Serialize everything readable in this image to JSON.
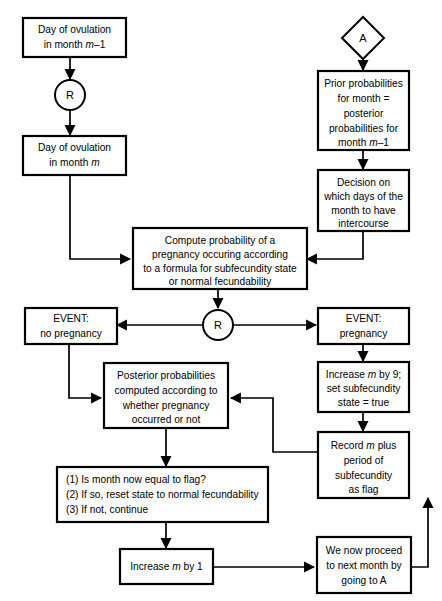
{
  "diagram": {
    "colors": {
      "background": "#ffffff",
      "stroke": "#000000",
      "fill": "#ffffff"
    },
    "nodes": {
      "day_ovulation_prev": {
        "line1": "Day of ovulation",
        "line2a": "in month ",
        "line2b": "m",
        "line2c": "–1"
      },
      "connector_r_top": {
        "label": "R"
      },
      "day_ovulation_cur": {
        "line1": "Day of ovulation",
        "line2a": "in month ",
        "line2b": "m"
      },
      "connector_a": {
        "label": "A"
      },
      "prior_probabilities": {
        "line1": "Prior probabilities",
        "line2": "for month =",
        "line3": "posterior",
        "line4": "probabilities for",
        "line5a": "month ",
        "line5b": "m",
        "line5c": "–1"
      },
      "decision_days": {
        "line1": "Decision on",
        "line2": "which days of the",
        "line3": "month to have",
        "line4": "intercourse"
      },
      "compute_probability": {
        "line1": "Compute probability of a",
        "line2": "pregnancy occuring according",
        "line3": "to a formula for subfecundity state",
        "line4": "or normal fecundability"
      },
      "connector_r_mid": {
        "label": "R"
      },
      "event_no_pregnancy": {
        "line1": "EVENT:",
        "line2": "no pregnancy"
      },
      "event_pregnancy": {
        "line1": "EVENT:",
        "line2": "pregnancy"
      },
      "posterior_probabilities": {
        "line1": "Posterior probabilities",
        "line2": "computed according to",
        "line3": "whether pregnancy",
        "line4": "occurred or not"
      },
      "increase_m_by_9": {
        "line1a": "Increase ",
        "line1b": "m",
        "line1c": " by 9;",
        "line2": "set subfecundity",
        "line3": "state = true"
      },
      "record_flag": {
        "line1a": "Record ",
        "line1b": "m",
        "line1c": " plus",
        "line2": "period of",
        "line3": "subfecundity",
        "line4": "as flag"
      },
      "check_flag_list": {
        "item1": "(1) Is month now equal to flag?",
        "item2": "(2) If so, reset state to normal fecundability",
        "item3": "(3) If not, continue"
      },
      "increase_m_by_1": {
        "line1a": "Increase ",
        "line1b": "m",
        "line1c": " by 1"
      },
      "proceed_next_month": {
        "line1": "We now proceed",
        "line2": "to next month by",
        "line3": "going to A"
      }
    }
  }
}
